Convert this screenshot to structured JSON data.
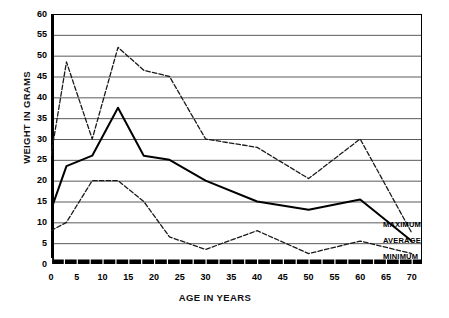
{
  "chart_data": {
    "type": "line",
    "title": "",
    "xlabel": "AGE IN YEARS",
    "ylabel": "WEIGHT IN GRAMS",
    "xlim": [
      0,
      72
    ],
    "ylim": [
      0,
      60
    ],
    "x_ticks": [
      0,
      5,
      10,
      15,
      20,
      25,
      30,
      35,
      40,
      45,
      50,
      55,
      60,
      65,
      70
    ],
    "y_ticks": [
      0,
      5,
      10,
      15,
      20,
      25,
      30,
      35,
      40,
      45,
      50,
      55,
      60
    ],
    "grid": "horizontal",
    "legend_position": "right-inside",
    "x": [
      0,
      3,
      8,
      13,
      18,
      23,
      30,
      40,
      50,
      60,
      70
    ],
    "series": [
      {
        "name": "MAXIMUM",
        "style": "dashed",
        "color": "#1a1a1a",
        "values": [
          26,
          48.5,
          30,
          52,
          46.5,
          45,
          30,
          28,
          20.5,
          30,
          7.5
        ]
      },
      {
        "name": "AVERAGE",
        "style": "solid",
        "color": "#000000",
        "values": [
          13,
          23.5,
          26,
          37.5,
          26,
          25,
          20,
          15,
          13,
          15.5,
          5.5
        ]
      },
      {
        "name": "MINIMUM",
        "style": "dashed",
        "color": "#1a1a1a",
        "values": [
          8,
          10,
          20,
          20,
          15,
          6.5,
          3.5,
          8,
          2.5,
          5.5,
          2.5
        ]
      }
    ]
  },
  "axes": {
    "y_title": "WEIGHT IN GRAMS",
    "x_title": "AGE IN YEARS",
    "y_tick_labels": [
      "60",
      "55",
      "50",
      "45",
      "40",
      "35",
      "30",
      "25",
      "20",
      "15",
      "10",
      "5",
      "0"
    ],
    "x_tick_labels": [
      "0",
      "5",
      "10",
      "15",
      "20",
      "25",
      "30",
      "35",
      "40",
      "45",
      "50",
      "55",
      "60",
      "65",
      "70"
    ]
  },
  "legend": {
    "entries": [
      {
        "label": "MAXIMUM"
      },
      {
        "label": "AVERAGE"
      },
      {
        "label": "MINIMUM"
      }
    ]
  }
}
